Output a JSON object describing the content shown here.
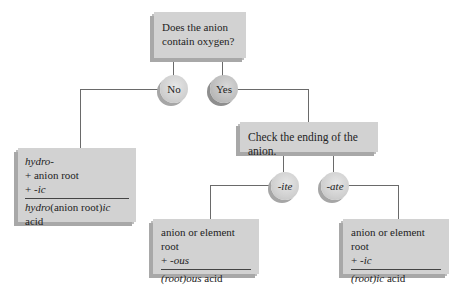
{
  "diagram": {
    "question_box": {
      "line1": "Does the anion",
      "line2": "contain oxygen?"
    },
    "branches": {
      "no_label": "No",
      "yes_label": "Yes"
    },
    "no_result": {
      "line1": "hydro-",
      "line2": "+ anion root",
      "line3_prefix": "+ ",
      "line3_suffix": "-ic",
      "result_prefix": "hydro",
      "result_middle": "(anion root)",
      "result_suffix": "ic",
      "result_end": " acid"
    },
    "check_box": {
      "text": "Check the ending of the anion."
    },
    "ending_branches": {
      "ite_label": "-ite",
      "ate_label": "-ate"
    },
    "ite_result": {
      "line1": "anion or element root",
      "line2_prefix": "+ ",
      "line2_suffix": "-ous",
      "result_prefix": "(root)",
      "result_suffix": "ous",
      "result_end": " acid"
    },
    "ate_result": {
      "line1": "anion or element root",
      "line2_prefix": "+ ",
      "line2_suffix": "-ic",
      "result_prefix": "(root)",
      "result_suffix": "ic",
      "result_end": " acid"
    }
  }
}
